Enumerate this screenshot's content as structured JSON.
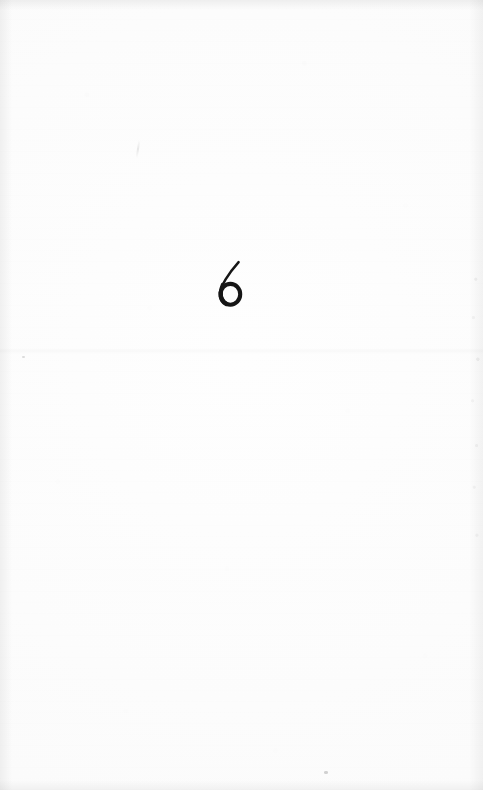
{
  "document": {
    "kind": "scanned-book-page",
    "page_number": "6",
    "body_text": "",
    "width": 483,
    "height": 790
  },
  "paper": {
    "background_color": "#fcfcfc",
    "tone": "near-white",
    "has_texture": true,
    "has_crease": true,
    "crease_label": "horizontal-fold-crease"
  },
  "ink": {
    "color": "#161616",
    "style": "handwritten",
    "stroke_description": "thin diagonal entry stroke descending right-to-left into a thick closed round bowl"
  },
  "marks": {
    "speck_bottom_label": "dust-speck",
    "speck_left_label": "dust-speck",
    "faint_tick_label": "faint-pencil-tick"
  },
  "edges": {
    "top_label": "scan-edge-shadow-top",
    "bottom_label": "scan-edge-shadow-bottom",
    "left_label": "scan-edge-shadow-left",
    "right_label": "scan-edge-shadow-right",
    "speckle_label": "scan-noise-speckle"
  }
}
